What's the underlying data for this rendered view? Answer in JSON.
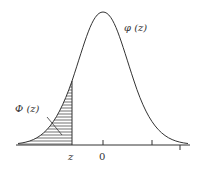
{
  "diagram": {
    "curve_label": "φ (z)",
    "area_label": "Φ (z)",
    "x_labels": {
      "z": "z",
      "zero": "0"
    },
    "colors": {
      "stroke": "#333333",
      "hatch": "#333333",
      "background": "#ffffff"
    }
  }
}
